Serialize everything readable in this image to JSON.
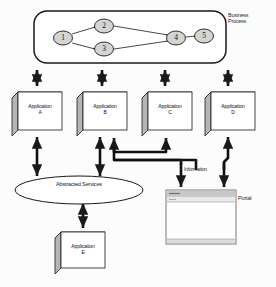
{
  "diagram": {
    "title_labels": {
      "business_process": "Business\nProcess",
      "portal": "Portal",
      "information": "Information",
      "abstracted_services": "Abstracted Services"
    },
    "process_nodes": [
      {
        "id": "n1",
        "label": "1",
        "cx": 63,
        "cy": 38
      },
      {
        "id": "n2",
        "label": "2",
        "cx": 104,
        "cy": 26
      },
      {
        "id": "n3",
        "label": "3",
        "cx": 104,
        "cy": 49
      },
      {
        "id": "n4",
        "label": "4",
        "cx": 176,
        "cy": 38
      },
      {
        "id": "n5",
        "label": "5",
        "cx": 204,
        "cy": 36
      }
    ],
    "process_edges": [
      {
        "from": "n1",
        "to": "n2"
      },
      {
        "from": "n1",
        "to": "n3"
      },
      {
        "from": "n2",
        "to": "n4"
      },
      {
        "from": "n3",
        "to": "n4"
      },
      {
        "from": "n4",
        "to": "n5"
      }
    ],
    "applications": [
      {
        "id": "app-a",
        "label": "Application\nA",
        "x": 12,
        "y": 92
      },
      {
        "id": "app-b",
        "label": "Application\nB",
        "x": 77,
        "y": 92
      },
      {
        "id": "app-c",
        "label": "Application\nC",
        "x": 142,
        "y": 92
      },
      {
        "id": "app-d",
        "label": "Application\nD",
        "x": 205,
        "y": 92
      },
      {
        "id": "app-e",
        "label": "Application\nE",
        "x": 55,
        "y": 232
      }
    ],
    "colors": {
      "stroke": "#1a1a1a",
      "box_face": "#ffffff",
      "box_shade": "#b5b5b5",
      "box_top": "#cfcfcf",
      "node_fill": "#d4d4d4",
      "portal_titlebar": "#c8c8c8",
      "portal_body": "#fdfdfd",
      "background": "#fcfcfc"
    }
  }
}
